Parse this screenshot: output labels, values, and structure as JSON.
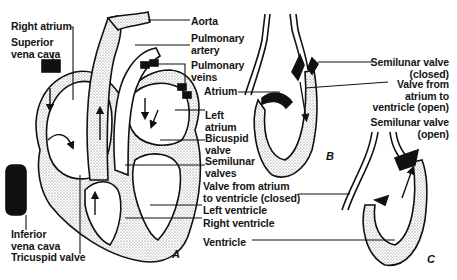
{
  "figure": {
    "panels": [
      "A",
      "B",
      "C"
    ],
    "labels_left": {
      "right_atrium": "Right atrium",
      "superior_vena_cava": [
        "Superior",
        "vena cava"
      ],
      "inferior_vena_cava": [
        "Inferior",
        "vena cava"
      ],
      "tricuspid_valve": "Tricuspid valve"
    },
    "labels_center": {
      "aorta": "Aorta",
      "pulmonary_artery": [
        "Pulmonary",
        "artery"
      ],
      "pulmonary_veins": [
        "Pulmonary",
        "veins"
      ],
      "left_atrium": [
        "Left",
        "atrium"
      ],
      "bicuspid_valve": [
        "Bicuspid",
        "valve"
      ],
      "semilunar_valves": [
        "Semilunar",
        "valves"
      ],
      "valve_atrium_ventricle_closed": [
        "Valve from atrium",
        "to ventricle (closed)"
      ],
      "left_ventricle": "Left ventricle",
      "right_ventricle": "Right ventricle",
      "ventricle": "Ventricle",
      "atrium": "Atrium"
    },
    "labels_right": {
      "semilunar_valve_closed": [
        "Semilunar valve",
        "(closed)"
      ],
      "valve_atrium_ventricle_open": [
        "Valve from",
        "atrium to",
        "ventricle (open)"
      ],
      "semilunar_valve_open": [
        "Semilunar valve",
        "(open)"
      ]
    },
    "colors": {
      "ink": "#151515",
      "stipple": "#bdbdbd",
      "background": "#ffffff"
    }
  }
}
